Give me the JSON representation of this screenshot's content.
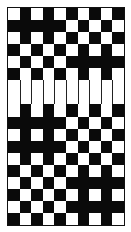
{
  "title": "",
  "diagram": {
    "type": "weave-draft-pattern",
    "columns": 10,
    "colors": {
      "filled": "#0a0a0a",
      "empty": "#ffffff"
    },
    "rows": [
      "WBWBWBWBWB",
      "BBBBBWBWBW",
      "WBWBWBWBWB",
      "BWBWBWBWBW",
      "WBWBWBBBBB",
      "BWBWBWBWBW",
      "BAND",
      "WBWBWBWBWB",
      "BBBBBWBWBW",
      "WBWBWBWBWB",
      "BBBBBWBWBW",
      "WBWBWBWBWB",
      "BWBWBWBWBW",
      "WBWBWBBBBB",
      "BWBWBWBWBW",
      "WBWBWBBBBB",
      "BWBWBWBWBW"
    ]
  }
}
